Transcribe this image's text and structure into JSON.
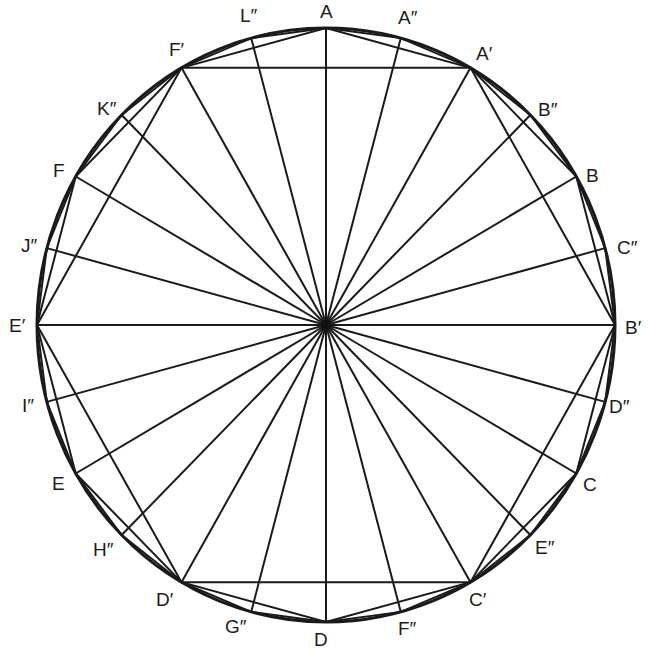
{
  "diagram": {
    "type": "inscribed regular polygons (hexagon, 12-gon, 24-gon) with radii",
    "center": {
      "x": 326,
      "y": 325
    },
    "radius_x": 289,
    "radius_y": 297,
    "line_color": "#1a1a1a",
    "background": "#ffffff",
    "points": [
      {
        "name": "A",
        "angle": 0,
        "label": "A",
        "lx": 320,
        "ly": 2
      },
      {
        "name": "A2",
        "angle": 15,
        "label": "A″",
        "lx": 398,
        "ly": 8
      },
      {
        "name": "A1",
        "angle": 30,
        "label": "A′",
        "lx": 476,
        "ly": 44
      },
      {
        "name": "B2",
        "angle": 45,
        "label": "B″",
        "lx": 538,
        "ly": 100
      },
      {
        "name": "B",
        "angle": 60,
        "label": "B",
        "lx": 586,
        "ly": 166
      },
      {
        "name": "C2",
        "angle": 75,
        "label": "C″",
        "lx": 617,
        "ly": 238
      },
      {
        "name": "B1",
        "angle": 90,
        "label": "B′",
        "lx": 625,
        "ly": 318
      },
      {
        "name": "D2",
        "angle": 105,
        "label": "D″",
        "lx": 609,
        "ly": 397
      },
      {
        "name": "C",
        "angle": 120,
        "label": "C",
        "lx": 583,
        "ly": 475
      },
      {
        "name": "E2",
        "angle": 135,
        "label": "E″",
        "lx": 535,
        "ly": 538
      },
      {
        "name": "C1",
        "angle": 150,
        "label": "C′",
        "lx": 469,
        "ly": 590
      },
      {
        "name": "F2",
        "angle": 165,
        "label": "F″",
        "lx": 398,
        "ly": 619
      },
      {
        "name": "D",
        "angle": 180,
        "label": "D",
        "lx": 314,
        "ly": 630
      },
      {
        "name": "G2",
        "angle": 195,
        "label": "G″",
        "lx": 225,
        "ly": 617
      },
      {
        "name": "D1",
        "angle": 210,
        "label": "D′",
        "lx": 156,
        "ly": 590
      },
      {
        "name": "H2",
        "angle": 225,
        "label": "H″",
        "lx": 93,
        "ly": 540
      },
      {
        "name": "E",
        "angle": 240,
        "label": "E",
        "lx": 52,
        "ly": 474
      },
      {
        "name": "I2",
        "angle": 255,
        "label": "I″",
        "lx": 22,
        "ly": 396
      },
      {
        "name": "E1",
        "angle": 270,
        "label": "E′",
        "lx": 9,
        "ly": 316
      },
      {
        "name": "J2",
        "angle": 285,
        "label": "J″",
        "lx": 21,
        "ly": 236
      },
      {
        "name": "F",
        "angle": 300,
        "label": "F",
        "lx": 53,
        "ly": 161
      },
      {
        "name": "K2",
        "angle": 315,
        "label": "K″",
        "lx": 97,
        "ly": 99
      },
      {
        "name": "F1",
        "angle": 330,
        "label": "F′",
        "lx": 169,
        "ly": 40
      },
      {
        "name": "L2",
        "angle": 345,
        "label": "L″",
        "lx": 240,
        "ly": 6
      }
    ],
    "polygons": [
      {
        "name": "hexagon",
        "step": 4,
        "offset": 2
      },
      {
        "name": "dodecagon",
        "step": 2,
        "offset": 0
      },
      {
        "name": "icositetragon",
        "step": 1,
        "offset": 0
      }
    ]
  }
}
